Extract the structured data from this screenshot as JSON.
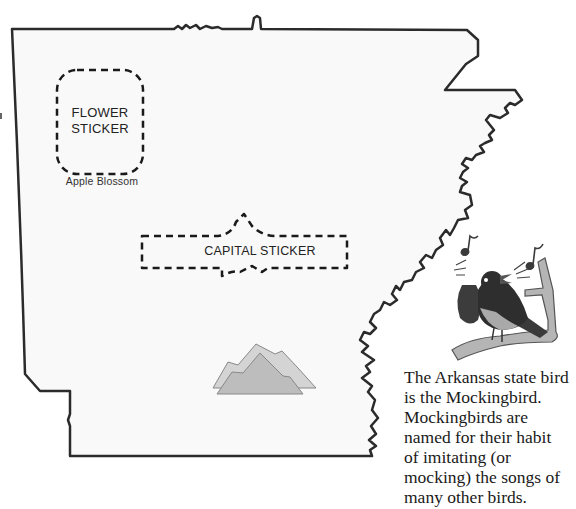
{
  "map": {
    "state": "Arkansas",
    "outline_color": "#2b2b2b",
    "fill_color": "#f9f9f9"
  },
  "flower_sticker": {
    "label_line1": "FLOWER",
    "label_line2": "STICKER",
    "caption": "Apple Blossom"
  },
  "capital_sticker": {
    "label": "CAPITAL STICKER"
  },
  "mountains": {
    "icon": "mountains-icon",
    "color": "#c8c8c8"
  },
  "bird": {
    "icon": "mockingbird-icon",
    "notes_icon": "music-note-icon"
  },
  "fact": {
    "lines": [
      "The Arkansas state bird",
      "is the Mockingbird.",
      "Mockingbirds are",
      "named for their habit",
      "of imitating (or",
      "mocking) the songs of",
      "many other birds."
    ]
  }
}
